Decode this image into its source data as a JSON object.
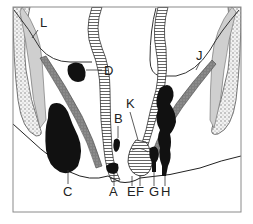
{
  "figure": {
    "type": "anatomical cross-section diagram",
    "frame_color": "#8a8a8a",
    "fill_dark": "#111111",
    "muscle_color": "#8c8c8c",
    "bone_color": "#d8d8d8",
    "labels": [
      {
        "id": "A",
        "text": "A"
      },
      {
        "id": "B",
        "text": "B"
      },
      {
        "id": "C",
        "text": "C"
      },
      {
        "id": "D",
        "text": "D"
      },
      {
        "id": "E",
        "text": "E"
      },
      {
        "id": "F",
        "text": "F"
      },
      {
        "id": "G",
        "text": "G"
      },
      {
        "id": "H",
        "text": "H"
      },
      {
        "id": "J",
        "text": "J"
      },
      {
        "id": "K",
        "text": "K"
      },
      {
        "id": "L",
        "text": "L"
      }
    ]
  }
}
